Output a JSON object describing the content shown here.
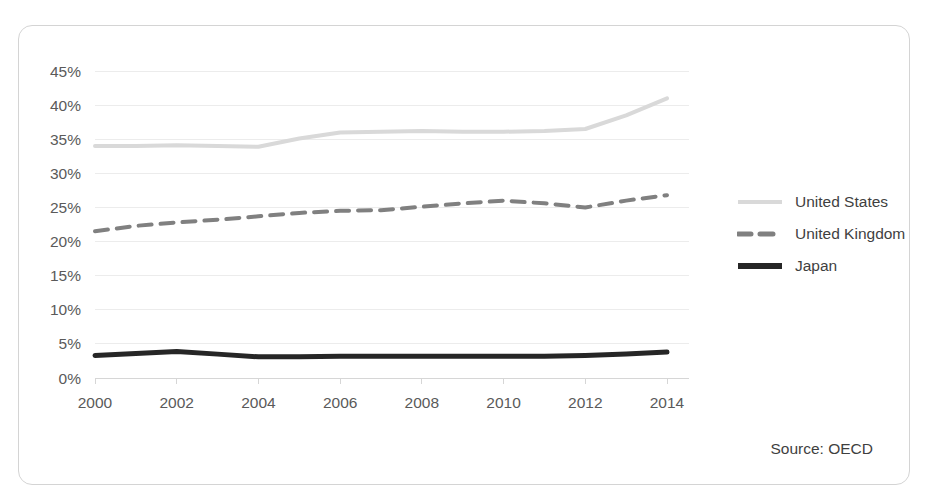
{
  "card": {
    "source_note": "Source: OECD"
  },
  "chart_data": {
    "type": "line",
    "title": "",
    "subtitle": "",
    "xlabel": "",
    "ylabel": "",
    "x": [
      2000,
      2001,
      2002,
      2003,
      2004,
      2005,
      2006,
      2007,
      2008,
      2009,
      2010,
      2011,
      2012,
      2013,
      2014
    ],
    "xtick_labels": [
      "2000",
      "2002",
      "2004",
      "2006",
      "2008",
      "2010",
      "2012",
      "2014"
    ],
    "xtick_values": [
      2000,
      2002,
      2004,
      2006,
      2008,
      2010,
      2012,
      2014
    ],
    "xlim": [
      2000,
      2014
    ],
    "ytick_labels": [
      "0%",
      "5%",
      "10%",
      "15%",
      "20%",
      "25%",
      "30%",
      "35%",
      "40%",
      "45%"
    ],
    "ytick_values": [
      0,
      5,
      10,
      15,
      20,
      25,
      30,
      35,
      40,
      45
    ],
    "ylim": [
      0,
      45
    ],
    "y_unit": "%",
    "grid": true,
    "legend_position": "right",
    "series": [
      {
        "name": "United States",
        "color": "#d9d9d9",
        "style": "solid",
        "width": 4,
        "values": [
          34.0,
          34.0,
          34.1,
          34.0,
          33.9,
          35.1,
          36.0,
          36.1,
          36.2,
          36.1,
          36.1,
          36.2,
          36.5,
          38.5,
          41.0
        ]
      },
      {
        "name": "United Kingdom",
        "color": "#808080",
        "style": "dashed",
        "width": 4,
        "values": [
          21.5,
          22.3,
          22.8,
          23.2,
          23.7,
          24.2,
          24.5,
          24.6,
          25.1,
          25.6,
          26.0,
          25.6,
          25.0,
          26.0,
          26.8
        ]
      },
      {
        "name": "Japan",
        "color": "#262626",
        "style": "solid",
        "width": 5,
        "values": [
          3.3,
          3.6,
          3.9,
          3.5,
          3.1,
          3.1,
          3.2,
          3.2,
          3.2,
          3.2,
          3.2,
          3.2,
          3.3,
          3.5,
          3.8
        ]
      }
    ]
  },
  "legend": {
    "items": [
      {
        "label": "United States"
      },
      {
        "label": "United Kingdom"
      },
      {
        "label": "Japan"
      }
    ]
  }
}
